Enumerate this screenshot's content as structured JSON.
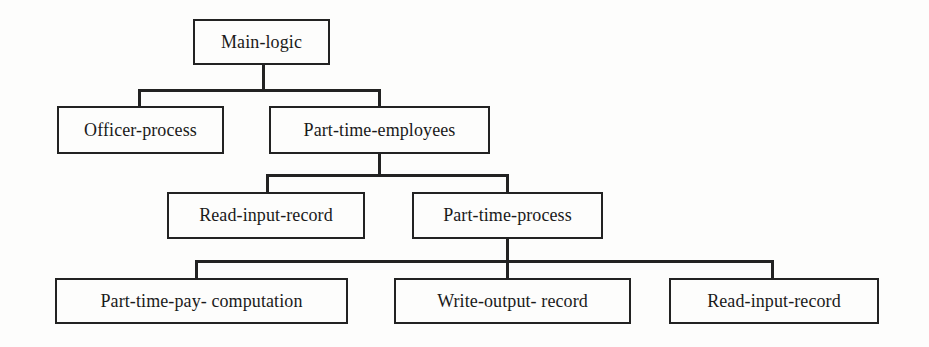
{
  "diagram": {
    "type": "hierarchy-chart",
    "line_color": "#222222",
    "background": "#fdfdfc",
    "nodes": {
      "main_logic": {
        "label": "Main-logic"
      },
      "officer_process": {
        "label": "Officer-process"
      },
      "part_time_employees": {
        "label": "Part-time-employees"
      },
      "read_input_record_1": {
        "label": "Read-input-record"
      },
      "part_time_process": {
        "label": "Part-time-process"
      },
      "part_time_pay_computation": {
        "label": "Part-time-pay- computation"
      },
      "write_output_record": {
        "label": "Write-output- record"
      },
      "read_input_record_2": {
        "label": "Read-input-record"
      }
    },
    "edges": [
      {
        "from": "Main-logic",
        "to": "Officer-process"
      },
      {
        "from": "Main-logic",
        "to": "Part-time-employees"
      },
      {
        "from": "Part-time-employees",
        "to": "Read-input-record"
      },
      {
        "from": "Part-time-employees",
        "to": "Part-time-process"
      },
      {
        "from": "Part-time-process",
        "to": "Part-time-pay- computation"
      },
      {
        "from": "Part-time-process",
        "to": "Write-output- record"
      },
      {
        "from": "Part-time-process",
        "to": "Read-input-record"
      }
    ]
  }
}
